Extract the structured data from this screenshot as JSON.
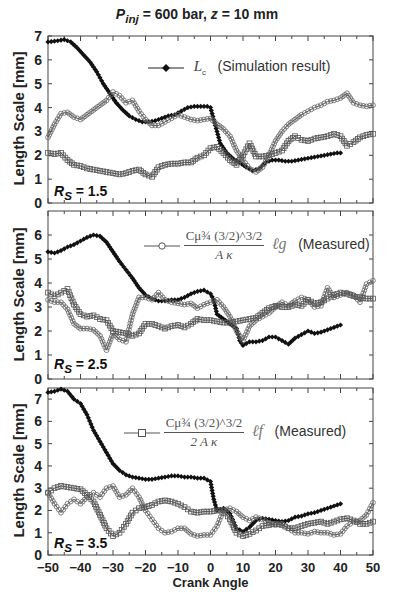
{
  "figure": {
    "title_parts": {
      "p": "P",
      "sub": "inj",
      "rest": " = 600 bar,  ",
      "z": "z",
      "rest2": " = 10 mm"
    },
    "xlabel": "Crank Angle",
    "ylabel": "Length Scale [mm]"
  },
  "legends": {
    "lc": {
      "symbol": "L",
      "sub": "c",
      "text": "(Simulation result)"
    },
    "lg": {
      "num": "Cμ¾ (3/2)^3/2",
      "den": "A κ",
      "ell": "ℓg",
      "text": "(Measured)"
    },
    "lf": {
      "num": "Cμ¾ (3/2)^3/2",
      "den": "2 A κ",
      "ell": "ℓf",
      "text": "(Measured)"
    }
  },
  "panels_labels": [
    {
      "rs": "R",
      "sub": "S",
      "value": " = 1.5"
    },
    {
      "rs": "R",
      "sub": "S",
      "value": " = 2.5"
    },
    {
      "rs": "R",
      "sub": "S",
      "value": " = 3.5"
    }
  ],
  "chart_data": [
    {
      "type": "line",
      "title": "Pinj = 600 bar, z = 10 mm  (Rs = 1.5)",
      "xlabel": "Crank Angle",
      "ylabel": "Length Scale [mm]",
      "xlim": [
        -50,
        50
      ],
      "ylim": [
        0,
        7
      ],
      "xticks": [
        -50,
        -40,
        -30,
        -20,
        -10,
        0,
        10,
        20,
        30,
        40,
        50
      ],
      "yticks": [
        0,
        1,
        2,
        3,
        4,
        5,
        6,
        7
      ],
      "legend": [
        "Lc (Simulation result)"
      ],
      "series": [
        {
          "name": "Lc (Simulation result)",
          "marker": "filled-diamond",
          "x": [
            -50,
            -47,
            -45,
            -43,
            -41,
            -39,
            -37,
            -35,
            -33,
            -31,
            -29,
            -27,
            -25,
            -23,
            -21,
            -19,
            -17,
            -15,
            -13,
            -11,
            -9,
            -7,
            -5,
            -3,
            -1,
            0,
            1,
            2,
            3,
            5,
            7,
            9,
            11,
            13,
            15,
            17,
            19,
            21,
            23,
            25,
            27,
            29,
            31,
            33,
            35,
            37,
            39,
            40
          ],
          "y": [
            6.75,
            6.8,
            6.85,
            6.75,
            6.5,
            6.2,
            5.9,
            5.5,
            5.0,
            4.6,
            4.2,
            3.9,
            3.65,
            3.5,
            3.4,
            3.4,
            3.45,
            3.55,
            3.65,
            3.7,
            3.85,
            4.0,
            4.05,
            4.05,
            4.05,
            4.0,
            3.5,
            3.0,
            2.5,
            2.1,
            1.85,
            1.7,
            1.5,
            1.35,
            1.45,
            1.7,
            1.8,
            1.8,
            1.75,
            1.75,
            1.8,
            1.85,
            1.9,
            1.95,
            2.0,
            2.05,
            2.1,
            2.1
          ]
        },
        {
          "name": "Cmu^3/4 (3/2)^3/2 / (A kappa) * lg (Measured)",
          "marker": "open-circle",
          "x": [
            -50,
            -48,
            -46,
            -44,
            -42,
            -40,
            -38,
            -36,
            -34,
            -32,
            -30,
            -28,
            -26,
            -24,
            -22,
            -20,
            -18,
            -16,
            -14,
            -12,
            -10,
            -8,
            -6,
            -4,
            -2,
            0,
            2,
            4,
            6,
            8,
            10,
            12,
            14,
            16,
            18,
            20,
            22,
            24,
            26,
            28,
            30,
            32,
            34,
            36,
            38,
            40,
            42,
            44,
            46,
            48,
            50
          ],
          "y": [
            2.75,
            3.3,
            3.75,
            3.8,
            3.6,
            3.5,
            3.7,
            3.9,
            4.1,
            4.3,
            4.65,
            4.5,
            4.2,
            4.3,
            3.85,
            3.5,
            3.25,
            3.25,
            3.4,
            3.55,
            3.7,
            3.6,
            3.5,
            3.45,
            3.5,
            3.55,
            3.3,
            3.1,
            2.8,
            2.2,
            1.8,
            1.45,
            1.3,
            1.5,
            2.0,
            2.6,
            3.0,
            3.3,
            3.5,
            3.7,
            3.85,
            4.0,
            4.1,
            4.25,
            4.3,
            4.4,
            4.6,
            4.2,
            4.1,
            4.05,
            4.1
          ]
        },
        {
          "name": "Cmu^3/4 (3/2)^3/2 / (2 A kappa) * lf (Measured)",
          "marker": "open-square",
          "x": [
            -50,
            -48,
            -46,
            -44,
            -42,
            -40,
            -38,
            -36,
            -34,
            -32,
            -30,
            -28,
            -26,
            -24,
            -22,
            -20,
            -18,
            -16,
            -14,
            -12,
            -10,
            -8,
            -6,
            -4,
            -2,
            0,
            2,
            4,
            6,
            8,
            10,
            12,
            14,
            16,
            18,
            20,
            22,
            24,
            26,
            28,
            30,
            32,
            34,
            36,
            38,
            40,
            42,
            44,
            46,
            48,
            50
          ],
          "y": [
            2.1,
            2.05,
            2.1,
            1.8,
            1.6,
            1.55,
            1.45,
            1.4,
            1.35,
            1.3,
            1.25,
            1.2,
            1.25,
            1.35,
            1.4,
            1.2,
            1.1,
            1.5,
            1.6,
            1.65,
            1.65,
            1.7,
            1.7,
            1.9,
            2.0,
            2.3,
            2.35,
            2.1,
            1.8,
            1.6,
            2.0,
            2.5,
            1.95,
            1.95,
            2.0,
            2.1,
            2.2,
            2.6,
            2.8,
            2.65,
            2.6,
            2.7,
            2.75,
            2.8,
            2.9,
            2.8,
            2.4,
            2.55,
            2.75,
            2.85,
            2.9
          ]
        }
      ]
    },
    {
      "type": "line",
      "title": "Rs = 2.5",
      "xlabel": "Crank Angle",
      "ylabel": "Length Scale [mm]",
      "xlim": [
        -50,
        50
      ],
      "ylim": [
        0,
        7
      ],
      "xticks": [
        -50,
        -40,
        -30,
        -20,
        -10,
        0,
        10,
        20,
        30,
        40,
        50
      ],
      "yticks": [
        0,
        1,
        2,
        3,
        4,
        5,
        6
      ],
      "legend": [
        "Cmu^3/4 (3/2)^3/2 / (A kappa) lg (Measured)"
      ],
      "series": [
        {
          "name": "Lc (Simulation result)",
          "marker": "filled-diamond",
          "x": [
            -50,
            -48,
            -46,
            -44,
            -42,
            -40,
            -38,
            -36,
            -34,
            -32,
            -30,
            -28,
            -26,
            -24,
            -22,
            -20,
            -18,
            -16,
            -14,
            -12,
            -10,
            -8,
            -6,
            -4,
            -2,
            0,
            1,
            2,
            4,
            6,
            8,
            9,
            10,
            12,
            14,
            16,
            18,
            20,
            22,
            24,
            26,
            28,
            30,
            32,
            34,
            36,
            38,
            40
          ],
          "y": [
            5.3,
            5.25,
            5.35,
            5.5,
            5.6,
            5.75,
            5.9,
            6.0,
            5.95,
            5.7,
            5.3,
            4.9,
            4.55,
            4.2,
            3.8,
            3.5,
            3.35,
            3.25,
            3.25,
            3.3,
            3.3,
            3.4,
            3.55,
            3.65,
            3.7,
            3.55,
            3.3,
            2.7,
            2.5,
            2.3,
            2.1,
            1.6,
            1.4,
            1.55,
            1.55,
            1.6,
            1.75,
            1.75,
            1.6,
            1.45,
            1.7,
            1.85,
            2.0,
            1.9,
            1.95,
            2.05,
            2.15,
            2.25
          ]
        },
        {
          "name": "Cmu^3/4 (3/2)^3/2 / (A kappa) lg (Measured)",
          "marker": "open-circle",
          "x": [
            -50,
            -48,
            -46,
            -44,
            -42,
            -40,
            -38,
            -36,
            -34,
            -32,
            -30,
            -28,
            -26,
            -24,
            -22,
            -20,
            -18,
            -16,
            -14,
            -12,
            -10,
            -8,
            -6,
            -4,
            -2,
            0,
            2,
            4,
            6,
            8,
            10,
            12,
            14,
            16,
            18,
            20,
            22,
            24,
            26,
            28,
            30,
            32,
            34,
            36,
            38,
            40,
            42,
            44,
            46,
            48,
            50
          ],
          "y": [
            3.3,
            3.2,
            3.2,
            2.9,
            2.3,
            2.1,
            2.1,
            2.05,
            1.8,
            1.2,
            1.9,
            1.65,
            1.55,
            2.7,
            3.4,
            3.4,
            3.3,
            3.6,
            3.3,
            3.2,
            3.15,
            3.1,
            3.15,
            2.95,
            3.1,
            3.2,
            3.3,
            3.0,
            2.6,
            2.0,
            1.6,
            2.2,
            2.45,
            2.6,
            2.75,
            3.0,
            3.2,
            3.05,
            3.25,
            3.4,
            3.3,
            3.0,
            3.05,
            3.8,
            3.4,
            3.5,
            3.6,
            3.5,
            3.2,
            3.95,
            4.1
          ]
        },
        {
          "name": "Cmu^3/4 (3/2)^3/2 / (2 A kappa) lf (Measured)",
          "marker": "open-square",
          "x": [
            -50,
            -48,
            -46,
            -44,
            -42,
            -40,
            -38,
            -36,
            -34,
            -32,
            -30,
            -28,
            -26,
            -24,
            -22,
            -20,
            -18,
            -16,
            -14,
            -12,
            -10,
            -8,
            -6,
            -4,
            -2,
            0,
            2,
            4,
            6,
            8,
            10,
            12,
            14,
            16,
            18,
            20,
            22,
            24,
            26,
            28,
            30,
            32,
            34,
            36,
            38,
            40,
            42,
            44,
            46,
            48,
            50
          ],
          "y": [
            3.6,
            3.45,
            3.6,
            3.75,
            3.1,
            2.7,
            2.6,
            2.65,
            2.5,
            2.45,
            2.0,
            1.95,
            1.9,
            1.8,
            1.9,
            2.3,
            2.3,
            2.2,
            2.1,
            2.2,
            2.25,
            2.15,
            2.3,
            2.5,
            2.45,
            2.45,
            2.4,
            2.35,
            2.35,
            2.4,
            2.45,
            2.5,
            2.55,
            2.75,
            2.95,
            3.05,
            3.0,
            3.0,
            3.1,
            3.05,
            3.3,
            3.15,
            3.2,
            3.35,
            3.5,
            3.6,
            3.55,
            3.45,
            3.4,
            3.35,
            3.35
          ]
        }
      ]
    },
    {
      "type": "line",
      "title": "Rs = 3.5",
      "xlabel": "Crank Angle",
      "ylabel": "Length Scale [mm]",
      "xlim": [
        -50,
        50
      ],
      "ylim": [
        0,
        7.5
      ],
      "xticks": [
        -50,
        -40,
        -30,
        -20,
        -10,
        0,
        10,
        20,
        30,
        40,
        50
      ],
      "yticks": [
        0,
        1,
        2,
        3,
        4,
        5,
        6,
        7
      ],
      "legend": [
        "Cmu^3/4 (3/2)^3/2 / (2 A kappa) lf (Measured)"
      ],
      "series": [
        {
          "name": "Lc (Simulation result)",
          "marker": "filled-diamond",
          "x": [
            -50,
            -48,
            -46,
            -44,
            -42,
            -40,
            -38,
            -36,
            -34,
            -32,
            -30,
            -28,
            -26,
            -24,
            -22,
            -20,
            -18,
            -16,
            -14,
            -12,
            -10,
            -8,
            -6,
            -4,
            -2,
            0,
            1,
            2,
            4,
            6,
            8,
            10,
            12,
            14,
            16,
            18,
            20,
            22,
            24,
            26,
            28,
            30,
            32,
            34,
            36,
            38,
            40
          ],
          "y": [
            7.3,
            7.35,
            7.45,
            7.35,
            7.0,
            6.8,
            6.3,
            5.6,
            5.1,
            4.6,
            4.1,
            3.8,
            3.6,
            3.5,
            3.45,
            3.4,
            3.4,
            3.45,
            3.5,
            3.55,
            3.55,
            3.5,
            3.5,
            3.45,
            3.45,
            3.3,
            2.5,
            2.0,
            2.1,
            1.85,
            1.2,
            1.05,
            1.25,
            1.55,
            1.65,
            1.6,
            1.55,
            1.5,
            1.55,
            1.7,
            1.75,
            1.85,
            1.9,
            2.0,
            2.1,
            2.2,
            2.3
          ]
        },
        {
          "name": "Cmu^3/4 (3/2)^3/2 / (A kappa) lg (Measured)",
          "marker": "open-circle",
          "x": [
            -50,
            -48,
            -46,
            -44,
            -42,
            -40,
            -38,
            -36,
            -34,
            -32,
            -30,
            -28,
            -26,
            -24,
            -22,
            -20,
            -18,
            -16,
            -14,
            -12,
            -10,
            -8,
            -6,
            -4,
            -2,
            0,
            2,
            4,
            6,
            8,
            10,
            12,
            14,
            16,
            18,
            20,
            22,
            24,
            26,
            28,
            30,
            32,
            34,
            36,
            38,
            40,
            42,
            44,
            46,
            48,
            50
          ],
          "y": [
            2.8,
            2.3,
            1.9,
            2.3,
            2.5,
            2.3,
            2.6,
            2.8,
            2.6,
            3.0,
            3.1,
            2.6,
            2.7,
            3.0,
            2.6,
            2.0,
            1.6,
            1.2,
            1.0,
            1.05,
            1.2,
            1.2,
            0.95,
            0.85,
            0.9,
            0.9,
            1.3,
            2.0,
            2.1,
            1.95,
            1.7,
            1.55,
            1.7,
            1.6,
            1.45,
            1.35,
            1.4,
            1.2,
            1.0,
            1.0,
            0.95,
            1.05,
            1.0,
            1.0,
            0.9,
            0.95,
            1.3,
            1.5,
            1.55,
            1.8,
            2.35
          ]
        },
        {
          "name": "Cmu^3/4 (3/2)^3/2 / (2 A kappa) lf (Measured)",
          "marker": "open-square",
          "x": [
            -50,
            -48,
            -46,
            -44,
            -42,
            -40,
            -38,
            -36,
            -34,
            -32,
            -30,
            -28,
            -26,
            -24,
            -22,
            -20,
            -18,
            -16,
            -14,
            -12,
            -10,
            -8,
            -6,
            -4,
            -2,
            0,
            2,
            4,
            6,
            8,
            10,
            12,
            14,
            16,
            18,
            20,
            22,
            24,
            26,
            28,
            30,
            32,
            34,
            36,
            38,
            40,
            42,
            44,
            46,
            48,
            50
          ],
          "y": [
            2.8,
            3.0,
            3.1,
            3.05,
            3.0,
            2.95,
            2.7,
            2.4,
            1.8,
            1.2,
            0.85,
            1.0,
            1.4,
            1.9,
            2.1,
            2.15,
            2.25,
            2.4,
            2.45,
            2.4,
            2.3,
            2.15,
            1.95,
            1.9,
            1.95,
            1.95,
            2.0,
            2.0,
            1.6,
            1.0,
            0.85,
            0.95,
            1.1,
            1.3,
            1.35,
            1.4,
            1.35,
            1.2,
            1.2,
            1.3,
            1.4,
            1.45,
            1.5,
            1.4,
            1.5,
            1.6,
            1.65,
            1.55,
            1.4,
            1.4,
            1.5
          ]
        }
      ]
    }
  ]
}
